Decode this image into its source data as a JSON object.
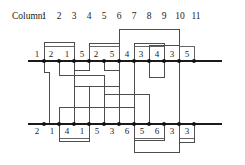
{
  "figure": {
    "header_label": "Column:",
    "columns": [
      "1",
      "2",
      "3",
      "4",
      "5",
      "6",
      "7",
      "8",
      "9",
      "10",
      "11"
    ],
    "top_row": {
      "name": "top-rail",
      "values": [
        "1",
        "2",
        "1",
        "5",
        "2",
        "5",
        "4",
        "3",
        "4",
        "3",
        "5"
      ]
    },
    "bottom_row": {
      "name": "bottom-rail",
      "values": [
        "2",
        "1",
        "4",
        "1",
        "5",
        "3",
        "6",
        "5",
        "6",
        "3",
        "3"
      ]
    },
    "top_boxes": [
      {
        "from": 1,
        "to": 3
      },
      {
        "from": 4,
        "to": 6
      },
      {
        "from": 7,
        "to": 9
      },
      {
        "from": 10,
        "to": 11
      }
    ],
    "bottom_boxes": [
      {
        "from": 2,
        "to": 4
      },
      {
        "from": 7,
        "to": 9
      },
      {
        "from": 10,
        "to": 11
      }
    ],
    "top_arcs": [
      {
        "from": 1,
        "to": 3
      },
      {
        "from": 4,
        "to": 6
      },
      {
        "from": 6,
        "to": 10
      },
      {
        "from": 7,
        "to": 9
      },
      {
        "from": 8,
        "to": 10
      }
    ],
    "bottom_arcs": [
      {
        "from": 2,
        "to": 4
      },
      {
        "from": 7,
        "to": 9
      },
      {
        "from": 7,
        "to": 10
      },
      {
        "from": 10,
        "to": 11
      }
    ],
    "colors": {
      "rail": "#1a1a1a",
      "wire": "#4d4d4d",
      "node": "#111111",
      "text": "#1a1a1a",
      "background": "#ffffff"
    },
    "geometry": {
      "column_count": 11,
      "first_column_x": 44,
      "column_spacing": 15,
      "top_rail_y": 61,
      "bottom_rail_y": 124,
      "node_radius": 1.9
    }
  }
}
